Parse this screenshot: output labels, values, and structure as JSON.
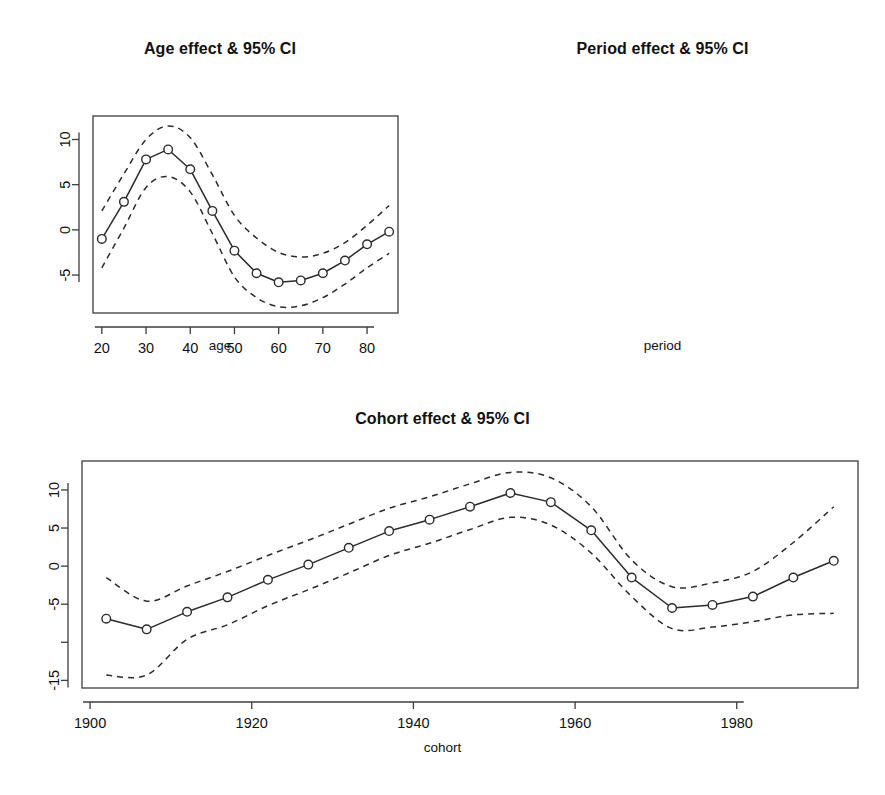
{
  "figure": {
    "background": "#ffffff",
    "line_color": "#2b2b2b",
    "axis_color": "#3d3d3d",
    "marker_fill": "#ffffff"
  },
  "panels": {
    "age": {
      "title": "Age effect & 95% CI",
      "xlabel": "age",
      "ylabel": ""
    },
    "period": {
      "title": "Period effect & 95% CI",
      "xlabel": "period",
      "ylabel": ""
    },
    "cohort": {
      "title": "Cohort effect & 95% CI",
      "xlabel": "cohort",
      "ylabel": ""
    }
  },
  "chart_data": [
    {
      "type": "line",
      "id": "age-effect",
      "title": "Age effect & 95% CI",
      "xlabel": "age",
      "ylabel": "",
      "grid": false,
      "legend": "none",
      "xlim": [
        18.0,
        87.0
      ],
      "ylim": [
        -9.2,
        12.6
      ],
      "xticks": [
        20,
        30,
        40,
        50,
        60,
        70,
        80
      ],
      "xtick_labels": [
        "20",
        "30",
        "40",
        "50",
        "60",
        "70",
        "80"
      ],
      "yticks": [
        -5,
        0,
        5,
        10
      ],
      "ytick_labels": [
        "-5",
        "0",
        "5",
        "10"
      ],
      "x": [
        20,
        25,
        30,
        35,
        40,
        45,
        50,
        55,
        60,
        65,
        70,
        75,
        80,
        85
      ],
      "series": [
        {
          "name": "estimate",
          "style": "solid-with-circles",
          "values": [
            -1.0,
            3.1,
            7.8,
            8.9,
            6.7,
            2.1,
            -2.3,
            -4.8,
            -5.8,
            -5.6,
            -4.8,
            -3.4,
            -1.6,
            -0.2
          ]
        },
        {
          "name": "upper 95% CI",
          "style": "dashed",
          "values": [
            2.1,
            6.2,
            10.0,
            11.5,
            10.2,
            6.1,
            1.6,
            -0.9,
            -2.5,
            -3.0,
            -2.6,
            -1.4,
            0.5,
            2.7
          ]
        },
        {
          "name": "lower 95% CI",
          "style": "dashed",
          "values": [
            -4.2,
            0.2,
            4.7,
            5.9,
            4.2,
            -0.4,
            -5.2,
            -7.5,
            -8.5,
            -8.4,
            -7.5,
            -6.0,
            -4.2,
            -2.6
          ]
        }
      ]
    },
    {
      "type": "line",
      "id": "period-effect",
      "title": "Period effect & 95% CI",
      "xlabel": "period",
      "ylabel": "",
      "grid": false,
      "legend": "none",
      "xlim": [
        1985.8,
        2013.2
      ],
      "ylim": [
        -7.4,
        11.0
      ],
      "xticks": [
        1990,
        1995,
        2000,
        2005,
        2010
      ],
      "xtick_labels": [
        "1990",
        "1995",
        "2000",
        "2005",
        "2010"
      ],
      "yticks": [
        -5,
        0,
        5,
        10
      ],
      "ytick_labels": [
        "-5",
        "0",
        "5",
        "10"
      ],
      "x": [
        1987,
        1992,
        1997,
        2002,
        2007,
        2012
      ],
      "series": [
        {
          "name": "estimate",
          "style": "solid-with-circles",
          "values": [
            2.8,
            8.1,
            -1.1,
            -2.0,
            -3.5,
            -4.5
          ]
        },
        {
          "name": "upper 95% CI",
          "style": "dashed",
          "values": [
            5.0,
            9.8,
            0.6,
            -0.3,
            -1.6,
            -2.8
          ]
        },
        {
          "name": "lower 95% CI",
          "style": "dashed",
          "values": [
            0.9,
            6.4,
            -2.8,
            -3.7,
            -5.4,
            -6.3
          ]
        }
      ]
    },
    {
      "type": "line",
      "id": "cohort-effect",
      "title": "Cohort effect & 95% CI",
      "xlabel": "cohort",
      "ylabel": "",
      "grid": false,
      "legend": "none",
      "xlim": [
        1899.0,
        1995.0
      ],
      "ylim": [
        -16.0,
        13.8
      ],
      "xticks": [
        1900,
        1920,
        1940,
        1960,
        1980
      ],
      "xtick_labels": [
        "1900",
        "1920",
        "1940",
        "1960",
        "1980"
      ],
      "yticks": [
        -15,
        -10,
        -5,
        0,
        5,
        10
      ],
      "ytick_labels": [
        "-15",
        "",
        "-5",
        "0",
        "5",
        "10"
      ],
      "x": [
        1902,
        1907,
        1912,
        1917,
        1922,
        1927,
        1932,
        1937,
        1942,
        1947,
        1952,
        1957,
        1962,
        1967,
        1972,
        1977,
        1982,
        1987,
        1992
      ],
      "series": [
        {
          "name": "estimate",
          "style": "solid-with-circles",
          "values": [
            -6.9,
            -8.3,
            -6.0,
            -4.1,
            -1.8,
            0.2,
            2.4,
            4.6,
            6.1,
            7.8,
            9.6,
            8.4,
            4.7,
            -1.5,
            -5.5,
            -5.1,
            -4.0,
            -1.5,
            0.7
          ]
        },
        {
          "name": "upper 95% CI",
          "style": "dashed",
          "values": [
            -1.5,
            -4.6,
            -2.6,
            -0.7,
            1.4,
            3.4,
            5.5,
            7.6,
            9.1,
            10.8,
            12.3,
            11.6,
            7.8,
            0.8,
            -2.7,
            -2.2,
            -0.7,
            3.1,
            7.8
          ]
        },
        {
          "name": "lower 95% CI",
          "style": "dashed",
          "values": [
            -14.3,
            -14.3,
            -9.6,
            -7.7,
            -5.2,
            -3.1,
            -0.9,
            1.4,
            3.0,
            4.8,
            6.4,
            5.4,
            1.7,
            -4.0,
            -8.2,
            -8.0,
            -7.3,
            -6.4,
            -6.2
          ]
        }
      ]
    }
  ]
}
